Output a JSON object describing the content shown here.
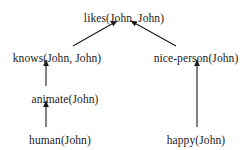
{
  "diagram": {
    "type": "inference-graph",
    "background_color": "#ffffff",
    "text_color": "#1a1a1a",
    "edge_color": "#1a1a1a",
    "nodes": [
      {
        "id": "likes",
        "label": "likes(John, John)",
        "cx": 124,
        "cy": 12
      },
      {
        "id": "knows",
        "label": "knows(John, John)",
        "cx": 57,
        "cy": 52
      },
      {
        "id": "nice_person",
        "label": "nice-person(John)",
        "cx": 196,
        "cy": 52
      },
      {
        "id": "animate",
        "label": "animate(John)",
        "cx": 65,
        "cy": 93
      },
      {
        "id": "human",
        "label": "human(John)",
        "cx": 60,
        "cy": 134
      },
      {
        "id": "happy",
        "label": "happy(John)",
        "cx": 196,
        "cy": 134
      }
    ],
    "edges": [
      {
        "id": "knows-to-likes",
        "from": "knows",
        "to": "likes",
        "x1": 73,
        "y1": 46,
        "x2": 117,
        "y2": 21,
        "orientation": "diagonal"
      },
      {
        "id": "nice-person-to-likes",
        "from": "nice_person",
        "to": "likes",
        "x1": 176,
        "y1": 46,
        "x2": 131,
        "y2": 21,
        "orientation": "diagonal"
      },
      {
        "id": "animate-to-knows",
        "from": "animate",
        "to": "knows",
        "x1": 46,
        "y1": 86,
        "x2": 46,
        "y2": 60,
        "orientation": "vertical"
      },
      {
        "id": "human-to-animate",
        "from": "human",
        "to": "animate",
        "x1": 46,
        "y1": 127,
        "x2": 46,
        "y2": 101,
        "orientation": "vertical"
      },
      {
        "id": "happy-to-nice-person",
        "from": "happy",
        "to": "nice_person",
        "x1": 197,
        "y1": 127,
        "x2": 197,
        "y2": 60,
        "orientation": "vertical"
      }
    ]
  }
}
